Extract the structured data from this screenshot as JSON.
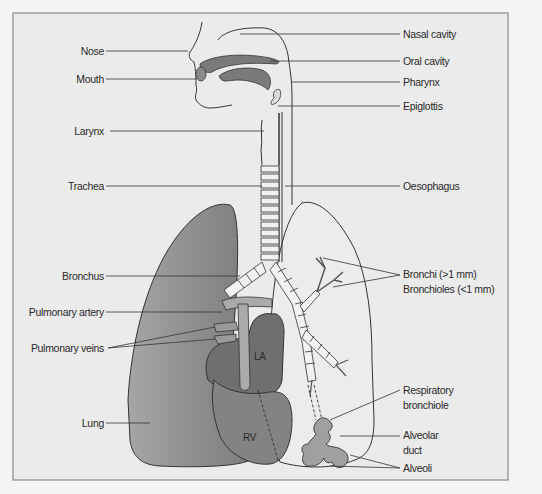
{
  "diagram": {
    "type": "anatomical illustration",
    "colors": {
      "background": "#f4f4f4",
      "panel": "#ebebeb",
      "frame": "#8a8a8a",
      "outline": "#333333",
      "left_lung": "#8c8c8c",
      "heart_dark": "#6f6f6f",
      "heart_rv": "#838383",
      "cavity": "#7a7a7a",
      "alveoli": "#a0a0a0"
    },
    "labels_left": [
      {
        "id": "nose",
        "text": "Nose"
      },
      {
        "id": "mouth",
        "text": "Mouth"
      },
      {
        "id": "larynx",
        "text": "Larynx"
      },
      {
        "id": "trachea",
        "text": "Trachea"
      },
      {
        "id": "bronchus",
        "text": "Bronchus"
      },
      {
        "id": "pulmonary_artery",
        "text": "Pulmonary artery"
      },
      {
        "id": "pulmonary_veins",
        "text": "Pulmonary veins"
      },
      {
        "id": "lung",
        "text": "Lung"
      }
    ],
    "labels_right": [
      {
        "id": "nasal_cavity",
        "text": "Nasal cavity"
      },
      {
        "id": "oral_cavity",
        "text": "Oral cavity"
      },
      {
        "id": "pharynx",
        "text": "Pharynx"
      },
      {
        "id": "epiglottis",
        "text": "Epiglottis"
      },
      {
        "id": "oesophagus",
        "text": "Oesophagus"
      },
      {
        "id": "bronchi",
        "text": "Bronchi (>1 mm)"
      },
      {
        "id": "bronchioles",
        "text": "Bronchioles (<1 mm)"
      },
      {
        "id": "respiratory_bronchiole_1",
        "text": "Respiratory"
      },
      {
        "id": "respiratory_bronchiole_2",
        "text": "bronchiole"
      },
      {
        "id": "alveolar_duct_1",
        "text": "Alveolar"
      },
      {
        "id": "alveolar_duct_2",
        "text": "duct"
      },
      {
        "id": "alveoli",
        "text": "Alveoli"
      }
    ],
    "organ_labels": [
      {
        "id": "la",
        "text": "LA"
      },
      {
        "id": "rv",
        "text": "RV"
      }
    ]
  }
}
